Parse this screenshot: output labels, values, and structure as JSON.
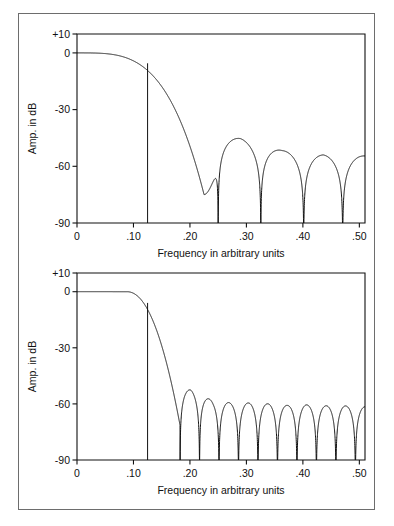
{
  "figure": {
    "background_color": "#ffffff",
    "frame_color": "#6d6d6d",
    "curve_color": "#111111",
    "axis_color": "#111111"
  },
  "charts": [
    {
      "id": "top",
      "xlabel": "Frequency in arbitrary units",
      "ylabel": "Amp. in dB",
      "xticks": [
        "0",
        ".10",
        ".20",
        ".30",
        ".40",
        ".50"
      ],
      "xtick_values": [
        0,
        0.1,
        0.2,
        0.3,
        0.4,
        0.5
      ],
      "yticks": [
        "+10",
        "0",
        "-30",
        "-60",
        "-90"
      ],
      "ytick_values": [
        10,
        0,
        -30,
        -60,
        -90
      ]
    },
    {
      "id": "bottom",
      "xlabel": "Frequency in arbitrary units",
      "ylabel": "Amp. in dB",
      "xticks": [
        "0",
        ".10",
        ".20",
        ".30",
        ".40",
        ".50"
      ],
      "xtick_values": [
        0,
        0.1,
        0.2,
        0.3,
        0.4,
        0.5
      ],
      "yticks": [
        "+10",
        "0",
        "-30",
        "-60",
        "-90"
      ],
      "ytick_values": [
        10,
        0,
        -30,
        -60,
        -90
      ]
    }
  ],
  "chart_data": [
    {
      "type": "line",
      "id": "top",
      "title": "",
      "xlabel": "Frequency in arbitrary units",
      "ylabel": "Amp. in dB",
      "xlim": [
        0,
        0.51
      ],
      "ylim": [
        -90,
        10
      ],
      "grid": false,
      "legend": "none",
      "xticks": [
        0,
        0.1,
        0.2,
        0.3,
        0.4,
        0.5
      ],
      "xticklabels": [
        "0",
        ".10",
        ".20",
        ".30",
        ".40",
        ".50"
      ],
      "yticks": [
        10,
        0,
        -30,
        -60,
        -90
      ],
      "yticklabels": [
        "+10",
        "0",
        "-30",
        "-60",
        "-90"
      ],
      "annotations": [
        {
          "type": "vline",
          "x": 0.125,
          "y0": -90,
          "y1": -5.5,
          "label": "cutoff marker"
        }
      ],
      "series": [
        {
          "name": "frequency response",
          "x": [
            0.0,
            0.005,
            0.01,
            0.015,
            0.02,
            0.025,
            0.03,
            0.035,
            0.04,
            0.045,
            0.05,
            0.055,
            0.06,
            0.065,
            0.07,
            0.075,
            0.08,
            0.085,
            0.09,
            0.095,
            0.1,
            0.105,
            0.11,
            0.115,
            0.12,
            0.125,
            0.13,
            0.135,
            0.14,
            0.145,
            0.15,
            0.155,
            0.16,
            0.165,
            0.17,
            0.175,
            0.18,
            0.185,
            0.19,
            0.195,
            0.2,
            0.205,
            0.21,
            0.215,
            0.22,
            0.225,
            0.23,
            0.235,
            0.24,
            0.245,
            0.25,
            0.255,
            0.26,
            0.265,
            0.27,
            0.275,
            0.28,
            0.285,
            0.29,
            0.295,
            0.3,
            0.305,
            0.31,
            0.315,
            0.32,
            0.325,
            0.33,
            0.335,
            0.34,
            0.345,
            0.35,
            0.355,
            0.36,
            0.365,
            0.37,
            0.375,
            0.38,
            0.385,
            0.39,
            0.395,
            0.4,
            0.405,
            0.41,
            0.415,
            0.42,
            0.425,
            0.43,
            0.435,
            0.44,
            0.445,
            0.45,
            0.455,
            0.46,
            0.465,
            0.47,
            0.475,
            0.48,
            0.485,
            0.49,
            0.495,
            0.5,
            0.51
          ],
          "y": [
            0.0,
            -0.02,
            -0.05,
            -0.1,
            -0.18,
            -0.28,
            -0.4,
            -0.55,
            -0.72,
            -0.92,
            -1.15,
            -1.4,
            -1.68,
            -2.0,
            -2.35,
            -2.74,
            -3.16,
            -3.63,
            -4.14,
            -4.7,
            -5.3,
            -5.97,
            -6.7,
            -7.5,
            -8.38,
            -9.35,
            -10.4,
            -11.6,
            -12.9,
            -14.4,
            -16.0,
            -17.8,
            -19.8,
            -22.1,
            -24.6,
            -27.4,
            -30.4,
            -33.6,
            -36.9,
            -40.2,
            -43.3,
            -46.2,
            -48.8,
            -51.2,
            -53.6,
            -56.2,
            -59.5,
            -64.2,
            -72.0,
            -80.0,
            -78.5,
            -68.0,
            -61.0,
            -55.8,
            -51.8,
            -48.8,
            -46.6,
            -45.6,
            -45.4,
            -46.0,
            -47.2,
            -48.9,
            -51.0,
            -53.6,
            -57.2,
            -63.0,
            -78.0,
            -88.0,
            -72.0,
            -64.0,
            -59.5,
            -56.2,
            -54.0,
            -52.6,
            -51.9,
            -51.8,
            -52.3,
            -53.4,
            -55.2,
            -58.0,
            -63.0,
            -80.0,
            -88.0,
            -70.0,
            -63.0,
            -59.0,
            -56.5,
            -55.0,
            -54.2,
            -54.0,
            -54.4,
            -55.4,
            -57.2,
            -60.5,
            -68.0,
            -88.0,
            -68.0,
            -62.0,
            -58.6,
            -56.5,
            -55.2,
            -54.6
          ],
          "nulls_x": [
            0.25,
            0.3255,
            0.4015,
            0.4705
          ],
          "sidelobe_peaks": [
            {
              "x": 0.289,
              "y": -45.3
            },
            {
              "x": 0.3635,
              "y": -51.7
            },
            {
              "x": 0.4365,
              "y": -53.9
            },
            {
              "x": 0.505,
              "y": -54.5
            }
          ],
          "passband_edge_x": 0.125,
          "passband_edge_y": -9.35
        }
      ]
    },
    {
      "type": "line",
      "id": "bottom",
      "title": "",
      "xlabel": "Frequency in arbitrary units",
      "ylabel": "Amp. in dB",
      "xlim": [
        0,
        0.51
      ],
      "ylim": [
        -90,
        10
      ],
      "grid": false,
      "legend": "none",
      "xticks": [
        0,
        0.1,
        0.2,
        0.3,
        0.4,
        0.5
      ],
      "xticklabels": [
        "0",
        ".10",
        ".20",
        ".30",
        ".40",
        ".50"
      ],
      "yticks": [
        10,
        0,
        -30,
        -60,
        -90
      ],
      "yticklabels": [
        "+10",
        "0",
        "-30",
        "-60",
        "-90"
      ],
      "annotations": [
        {
          "type": "vline",
          "x": 0.125,
          "y0": -90,
          "y1": -6.0,
          "label": "cutoff marker"
        }
      ],
      "series": [
        {
          "name": "frequency response",
          "description": "flat passband to ~0.09 then steep rolloff with many equal-null sidelobes near -60 dB",
          "passband_flat_until_x": 0.09,
          "passband_edge_x": 0.125,
          "passband_edge_y": -6.0,
          "first_null_x": 0.1825,
          "null_spacing": 0.0345,
          "nulls_x": [
            0.1825,
            0.2245,
            0.2595,
            0.292,
            0.325,
            0.357,
            0.3895,
            0.4215,
            0.454,
            0.486
          ],
          "sidelobe_peaks": [
            {
              "x": 0.2015,
              "y": -52.5
            },
            {
              "x": 0.2415,
              "y": -58.5
            },
            {
              "x": 0.2755,
              "y": -59.5
            },
            {
              "x": 0.3085,
              "y": -59.5
            },
            {
              "x": 0.341,
              "y": -60.0
            },
            {
              "x": 0.373,
              "y": -60.8
            },
            {
              "x": 0.4055,
              "y": -60.5
            },
            {
              "x": 0.4375,
              "y": -61.0
            },
            {
              "x": 0.47,
              "y": -61.0
            },
            {
              "x": 0.502,
              "y": -61.5
            }
          ]
        }
      ]
    }
  ]
}
